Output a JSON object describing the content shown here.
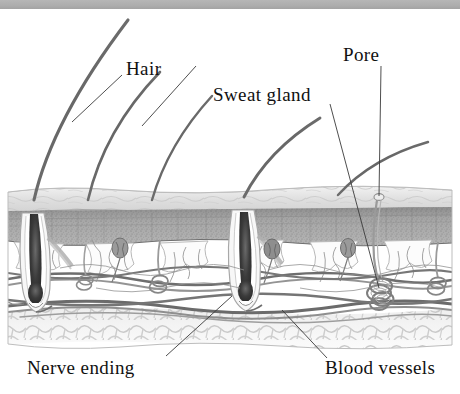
{
  "figure": {
    "top_bar": {
      "name": "page-edge-strip",
      "color": "#adadad"
    },
    "background_color": "#ffffff",
    "ink_color": "#111111"
  },
  "labels": {
    "hair": "Hair",
    "pore": "Pore",
    "sweat_gland": "Sweat gland",
    "nerve_ending": "Nerve ending",
    "blood_vessels": "Blood vessels"
  },
  "anatomy": {
    "layers": [
      {
        "name": "epidermis",
        "color": "#dcdcdc"
      },
      {
        "name": "dermis-stipple-band",
        "color": "#9e9e9e"
      },
      {
        "name": "papillary-dermis",
        "color": "#f4f4f4"
      },
      {
        "name": "vascular-plexus",
        "color": "#8a8a8a"
      },
      {
        "name": "subcutaneous-fat",
        "color": "#e2e2e2"
      }
    ],
    "hair_shafts": 5,
    "hair_follicles": 2,
    "sweat_glands": 4,
    "sensory_corpuscles": 3
  }
}
